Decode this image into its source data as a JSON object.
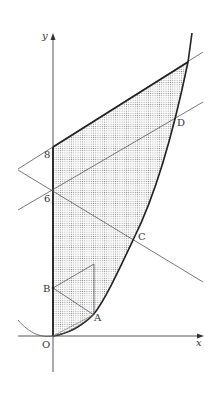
{
  "figure": {
    "type": "coordinate-geometry-diagram",
    "axes": {
      "x_label": "x",
      "y_label": "y",
      "origin_label": "O"
    },
    "y_ticks": [
      {
        "value": "8",
        "label": "8"
      },
      {
        "value": "6",
        "label": "6"
      }
    ],
    "points": {
      "A": "A",
      "B": "B",
      "C": "C",
      "D": "D"
    },
    "elements": [
      "parabola through O, A, C, D",
      "line through (0,8) parallel line (upper boundary)",
      "line through (0,6) and D",
      "line through (0,6) and C (decreasing)",
      "triangle B-A-vertex",
      "circle arc near origin",
      "dotted shaded region bounded by y-axis, parabola and upper line"
    ],
    "colors": {
      "stroke": "#333333",
      "shade": "#9a9a9a",
      "background": "#ffffff"
    }
  }
}
